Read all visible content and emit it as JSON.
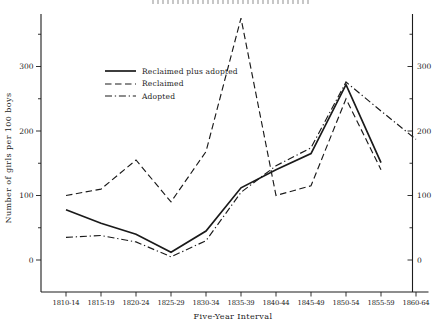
{
  "figure": {
    "y_axis_title": "Number of girls per 100 boys",
    "x_axis_title": "Five-Year Interval"
  },
  "legend": {
    "items": [
      {
        "label": "Reclaimed plus adopted",
        "style": "solid"
      },
      {
        "label": "Reclaimed",
        "style": "dashed"
      },
      {
        "label": "Adopted",
        "style": "dashdot"
      }
    ]
  },
  "chart_data": {
    "type": "line",
    "title": "",
    "xlabel": "Five-Year Interval",
    "ylabel": "Number of girls per 100 boys",
    "categories": [
      "1810-14",
      "1815-19",
      "1820-24",
      "1825-29",
      "1830-34",
      "1835-39",
      "1840-44",
      "1845-49",
      "1850-54",
      "1855-59",
      "1860-64"
    ],
    "series": [
      {
        "name": "Reclaimed plus adopted",
        "style": "solid",
        "values": [
          78,
          57,
          40,
          12,
          45,
          112,
          140,
          165,
          272,
          151,
          null
        ]
      },
      {
        "name": "Reclaimed",
        "style": "dashed",
        "values": [
          100,
          110,
          155,
          90,
          168,
          375,
          100,
          115,
          250,
          140,
          null
        ]
      },
      {
        "name": "Adopted",
        "style": "dashdot",
        "values": [
          35,
          38,
          28,
          5,
          30,
          105,
          146,
          174,
          276,
          231,
          187
        ]
      }
    ],
    "y_ticks": [
      0,
      100,
      200,
      300
    ],
    "y_minor_ticks": [
      50,
      150,
      250,
      350
    ],
    "ylim": [
      0,
      385
    ],
    "dual_axis": true,
    "grid": false,
    "legend_position": "upper-left-inside"
  },
  "colors": {
    "ink": "#1c1c1c",
    "paper": "#ffffff"
  }
}
